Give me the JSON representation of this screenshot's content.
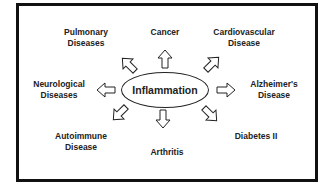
{
  "center": {
    "label": "Inflammation"
  },
  "nodes": [
    {
      "id": "pulmonary",
      "line1": "Pulmonary",
      "line2": "Diseases"
    },
    {
      "id": "cancer",
      "line1": "Cancer",
      "line2": ""
    },
    {
      "id": "cardiovascular",
      "line1": "Cardiovascular",
      "line2": "Disease"
    },
    {
      "id": "neurological",
      "line1": "Neurological",
      "line2": "Diseases"
    },
    {
      "id": "alzheimers",
      "line1": "Alzheimer's",
      "line2": "Disease"
    },
    {
      "id": "autoimmune",
      "line1": "Autoimmune",
      "line2": "Disease"
    },
    {
      "id": "arthritis",
      "line1": "Arthritis",
      "line2": ""
    },
    {
      "id": "diabetes",
      "line1": "Diabetes II",
      "line2": ""
    }
  ]
}
